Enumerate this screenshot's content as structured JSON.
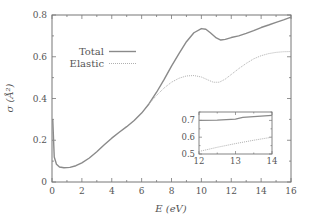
{
  "chart_data": {
    "type": "line",
    "title": "",
    "xlabel": "E (eV)",
    "ylabel": "σ (Å²)",
    "xlim": [
      0,
      16
    ],
    "ylim": [
      0,
      0.8
    ],
    "x_ticks": [
      "0",
      "2",
      "4",
      "6",
      "8",
      "10",
      "12",
      "14",
      "16"
    ],
    "y_ticks": [
      "0",
      "0.2",
      "0.4",
      "0.6",
      "0.8"
    ],
    "grid": false,
    "legend_position": "upper left",
    "series": [
      {
        "name": "Total",
        "style": "solid",
        "color": "#8a8a8a",
        "x": [
          0.05,
          0.15,
          0.3,
          0.5,
          0.8,
          1.2,
          1.6,
          2.0,
          2.5,
          3.0,
          3.5,
          4.0,
          4.5,
          5.0,
          5.5,
          6.0,
          6.5,
          7.0,
          7.5,
          8.0,
          8.5,
          9.0,
          9.5,
          10.0,
          10.3,
          10.6,
          11.0,
          11.3,
          11.6,
          12.0,
          12.5,
          13.0,
          13.5,
          14.0,
          14.5,
          15.0,
          15.5,
          16.0
        ],
        "y": [
          0.3,
          0.12,
          0.085,
          0.072,
          0.068,
          0.07,
          0.078,
          0.092,
          0.115,
          0.145,
          0.178,
          0.21,
          0.238,
          0.265,
          0.295,
          0.33,
          0.375,
          0.43,
          0.49,
          0.555,
          0.615,
          0.672,
          0.715,
          0.735,
          0.732,
          0.715,
          0.69,
          0.68,
          0.683,
          0.692,
          0.7,
          0.712,
          0.725,
          0.74,
          0.752,
          0.765,
          0.777,
          0.79
        ]
      },
      {
        "name": "Elastic",
        "style": "dotted",
        "color": "#b0b0b0",
        "x": [
          6.5,
          7.0,
          7.5,
          8.0,
          8.5,
          9.0,
          9.5,
          10.0,
          10.5,
          10.8,
          11.2,
          11.6,
          12.0,
          12.5,
          13.0,
          13.5,
          14.0,
          14.5,
          15.0,
          15.5,
          16.0
        ],
        "y": [
          0.375,
          0.415,
          0.45,
          0.478,
          0.497,
          0.508,
          0.51,
          0.503,
          0.487,
          0.478,
          0.478,
          0.493,
          0.515,
          0.543,
          0.568,
          0.59,
          0.605,
          0.615,
          0.621,
          0.624,
          0.625
        ]
      }
    ],
    "inset": {
      "xlim": [
        12,
        14
      ],
      "ylim": [
        0.5,
        0.75
      ],
      "x_ticks": [
        "12",
        "13",
        "14"
      ],
      "y_ticks": [
        "0.5",
        "0.6",
        "0.7"
      ],
      "series": [
        {
          "name": "Total",
          "x": [
            12.0,
            12.5,
            13.0,
            13.2,
            13.5,
            14.0
          ],
          "y": [
            0.7,
            0.702,
            0.708,
            0.718,
            0.722,
            0.73
          ]
        },
        {
          "name": "Elastic",
          "x": [
            12.0,
            12.5,
            13.0,
            13.5,
            14.0
          ],
          "y": [
            0.515,
            0.54,
            0.562,
            0.582,
            0.6
          ]
        }
      ]
    }
  },
  "legend": {
    "total_label": "Total",
    "elastic_label": "Elastic"
  },
  "axes": {
    "xlabel": "E (eV)",
    "ylabel": "σ (Å²)"
  }
}
